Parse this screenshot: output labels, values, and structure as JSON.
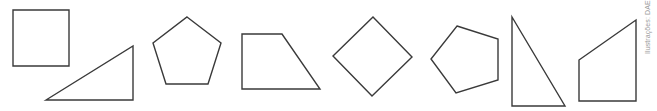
{
  "figure": {
    "credit": "Ilustrações: DAE",
    "stroke_color": "#3a3a3a",
    "shapes": [
      {
        "name": "square",
        "points": "13,10 69,10 69,66 13,66"
      },
      {
        "name": "right-triangle-wide",
        "points": "46,100 133,46 133,100"
      },
      {
        "name": "regular-pentagon",
        "points": "187,17 221,43 208,84 166,84 153,43"
      },
      {
        "name": "right-trapezoid",
        "points": "242,34 282,34 320,89 242,89"
      },
      {
        "name": "rotated-square",
        "points": "373,17 412,57 372,96 333,56"
      },
      {
        "name": "rotated-pentagon",
        "points": "457,26 498,39 498,80 456,93 431,59"
      },
      {
        "name": "right-triangle-tall",
        "points": "512,17 565,106 512,106"
      },
      {
        "name": "right-trapezoid-tall",
        "points": "579,60 636,20 636,101 579,101"
      }
    ]
  }
}
